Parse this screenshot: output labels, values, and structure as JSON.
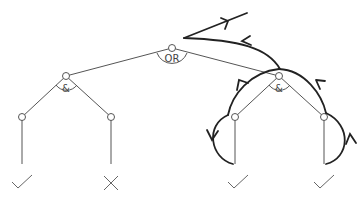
{
  "diagram": {
    "type": "and-or-tree",
    "root": {
      "label": "OR",
      "x": 172,
      "y": 48
    },
    "and_nodes": [
      {
        "label": "&",
        "x": 66,
        "y": 76
      },
      {
        "label": "&",
        "x": 279,
        "y": 76
      }
    ],
    "leaves": [
      {
        "x": 22,
        "y": 117,
        "result": "check"
      },
      {
        "x": 111,
        "y": 117,
        "result": "cross"
      },
      {
        "x": 235,
        "y": 117,
        "result": "check"
      },
      {
        "x": 324,
        "y": 117,
        "result": "check"
      }
    ],
    "traversal": "depth-first trace around right & subtree returning to OR, exiting up-right"
  }
}
